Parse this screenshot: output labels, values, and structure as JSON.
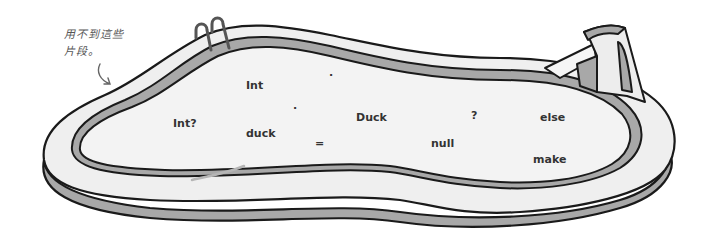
{
  "note": {
    "line1": "用不到這些",
    "line2": "片段。"
  },
  "snippets": [
    {
      "id": "int",
      "text": "Int",
      "x": 246,
      "y": 79
    },
    {
      "id": "dot-1",
      "text": ".",
      "x": 329,
      "y": 68
    },
    {
      "id": "dot-2",
      "text": ".",
      "x": 293,
      "y": 101
    },
    {
      "id": "int-nullable",
      "text": "Int?",
      "x": 173,
      "y": 117
    },
    {
      "id": "duck-lower",
      "text": "duck",
      "x": 246,
      "y": 127
    },
    {
      "id": "equals",
      "text": "=",
      "x": 315,
      "y": 138
    },
    {
      "id": "duck-class",
      "text": "Duck",
      "x": 356,
      "y": 111
    },
    {
      "id": "question",
      "text": "?",
      "x": 471,
      "y": 110
    },
    {
      "id": "else",
      "text": "else",
      "x": 540,
      "y": 111
    },
    {
      "id": "null",
      "text": "null",
      "x": 431,
      "y": 137
    },
    {
      "id": "make",
      "text": "make",
      "x": 533,
      "y": 153
    }
  ],
  "colors": {
    "outline": "#1a1a1a",
    "deck": "#efefef",
    "wall": "#a8a8a8",
    "water": "#f3f3f3",
    "text": "#333333",
    "note": "#555555"
  }
}
